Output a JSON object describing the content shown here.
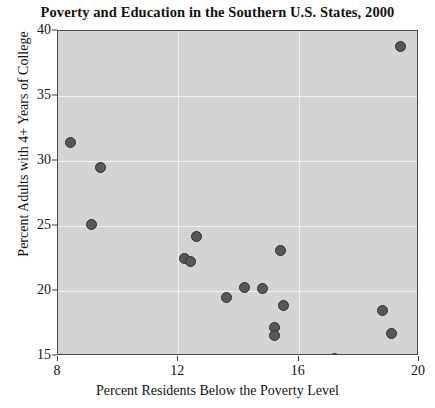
{
  "chart_data": {
    "type": "scatter",
    "title": "Poverty and Education in the Southern U.S. States, 2000",
    "xlabel": "Percent Residents Below the Poverty Level",
    "ylabel": "Percent Adults with 4+ Years of College",
    "xlim": [
      8,
      20
    ],
    "ylim": [
      15,
      40
    ],
    "xticks": [
      8,
      12,
      16,
      20
    ],
    "yticks": [
      15,
      20,
      25,
      30,
      35,
      40
    ],
    "grid": true,
    "legend": null,
    "marker_color": "#585858",
    "plot_background": "#d4d4d4",
    "gridline_color": "#f2f2f2",
    "points": [
      {
        "x": 8.4,
        "y": 31.4
      },
      {
        "x": 9.4,
        "y": 29.5
      },
      {
        "x": 9.1,
        "y": 25.1
      },
      {
        "x": 12.2,
        "y": 22.5
      },
      {
        "x": 12.4,
        "y": 22.3
      },
      {
        "x": 12.6,
        "y": 24.2
      },
      {
        "x": 13.6,
        "y": 19.5
      },
      {
        "x": 14.2,
        "y": 20.3
      },
      {
        "x": 14.8,
        "y": 20.2
      },
      {
        "x": 15.4,
        "y": 23.1
      },
      {
        "x": 15.5,
        "y": 18.9
      },
      {
        "x": 15.2,
        "y": 17.2
      },
      {
        "x": 15.2,
        "y": 16.6
      },
      {
        "x": 17.2,
        "y": 14.8
      },
      {
        "x": 18.8,
        "y": 18.5
      },
      {
        "x": 19.1,
        "y": 16.7
      },
      {
        "x": 19.4,
        "y": 38.8
      }
    ]
  }
}
